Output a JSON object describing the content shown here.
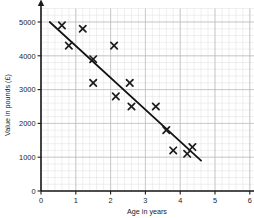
{
  "chart_data": {
    "type": "scatter",
    "title": "",
    "xlabel": "Age in years",
    "ylabel": "Value in pounds (£)",
    "xlim": [
      0,
      6.45
    ],
    "ylim": [
      0,
      5400
    ],
    "xticks": [
      "0",
      "1",
      "2",
      "3",
      "4",
      "5",
      "6"
    ],
    "xtick_values": [
      0,
      1,
      2,
      3,
      4,
      5,
      6
    ],
    "yticks": [
      "0",
      "1000",
      "2000",
      "3000",
      "4000",
      "5000"
    ],
    "ytick_values": [
      0,
      1000,
      2000,
      3000,
      4000,
      5000
    ],
    "grid": true,
    "grid_minor": true,
    "legend": "none",
    "marker": "x-cross",
    "points": [
      {
        "x": 0.6,
        "y": 4900
      },
      {
        "x": 1.2,
        "y": 4800
      },
      {
        "x": 0.8,
        "y": 4300
      },
      {
        "x": 2.1,
        "y": 4300
      },
      {
        "x": 1.5,
        "y": 3900
      },
      {
        "x": 1.5,
        "y": 3200
      },
      {
        "x": 2.55,
        "y": 3200
      },
      {
        "x": 2.15,
        "y": 2800
      },
      {
        "x": 2.6,
        "y": 2500
      },
      {
        "x": 3.3,
        "y": 2500
      },
      {
        "x": 3.6,
        "y": 1800
      },
      {
        "x": 3.8,
        "y": 1200
      },
      {
        "x": 4.2,
        "y": 1100
      },
      {
        "x": 4.35,
        "y": 1300
      }
    ],
    "trend_line": {
      "name": "line of best fit",
      "x0": 0.25,
      "y0": 5000,
      "x1": 4.6,
      "y1": 900
    },
    "colors": {
      "marker": "#1b1b1b",
      "trend_line": "#111111",
      "axis": "#1b1b1b",
      "grid_major": "#b9b9b9",
      "grid_minor": "#dedede",
      "background": "#ffffff"
    }
  }
}
